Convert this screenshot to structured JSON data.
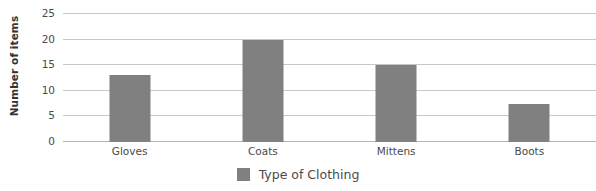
{
  "chart_data": {
    "type": "bar",
    "title": "",
    "xlabel": "",
    "ylabel": "Number of items",
    "categories": [
      "Gloves",
      "Coats",
      "Mittens",
      "Boots"
    ],
    "values": [
      13,
      20,
      15,
      7.5
    ],
    "ylim": [
      0,
      25
    ],
    "ytick_labels": [
      "0",
      "5",
      "10",
      "15",
      "20",
      "25"
    ],
    "ytick_values": [
      0,
      5,
      10,
      15,
      20,
      25
    ],
    "grid": true,
    "legend": {
      "position": "bottom",
      "entries": [
        {
          "label": "Type of Clothing",
          "color": "#808080",
          "swatch_icon": "square-swatch-icon"
        }
      ]
    },
    "colors": {
      "bar": "#808080",
      "gridline": "#c8c8c8",
      "baseline": "#b4b4b4",
      "text": "#4a4a4a",
      "axis_title": "#333333",
      "background": "#ffffff"
    }
  }
}
